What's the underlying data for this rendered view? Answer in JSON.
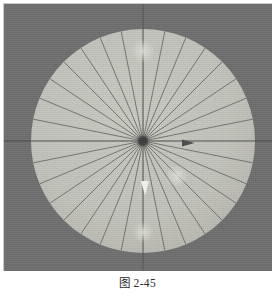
{
  "figure": {
    "caption": "图 2-45",
    "plate": {
      "background_color": "#6e6e6e",
      "border_color": "#c9c9c9",
      "width": 269,
      "height": 268
    }
  },
  "chart_data": {
    "type": "pie",
    "title": "图 2-45",
    "subtitle": "",
    "xlabel": "",
    "ylabel": "",
    "legend": [],
    "annotations": [
      {
        "name": "right-arrow-marker",
        "shape": "triangle-right",
        "color": "#4d4d4d",
        "x": 185,
        "y": 139,
        "size": 7
      },
      {
        "name": "down-arrow-marker",
        "shape": "triangle-down",
        "color": "#f2f2ee",
        "x": 141,
        "y": 186,
        "size": 9
      },
      {
        "name": "highlight-spot-upper",
        "shape": "soft-spot",
        "color": "#d8d8d2",
        "x": 139,
        "y": 47,
        "size": 12
      },
      {
        "name": "highlight-spot-lower-right",
        "shape": "soft-spot",
        "color": "#d6d6d0",
        "x": 173,
        "y": 172,
        "size": 11
      },
      {
        "name": "highlight-spot-bottom",
        "shape": "soft-spot",
        "color": "#d4d4ce",
        "x": 139,
        "y": 228,
        "size": 11
      }
    ],
    "disc": {
      "center_x": 139,
      "center_y": 137,
      "radius": 112,
      "fill_color": "#c3c3bc",
      "edge_color": "#b4b4ad"
    },
    "hub": {
      "center_x": 139,
      "center_y": 137,
      "radius": 7,
      "color": "#3c3c3c"
    },
    "spokes": {
      "count": 32,
      "start_angle_deg": 0,
      "step_angle_deg": 11.25,
      "line_color": "#6a6a66",
      "line_width": 0.9,
      "values": [
        11.25,
        11.25,
        11.25,
        11.25,
        11.25,
        11.25,
        11.25,
        11.25,
        11.25,
        11.25,
        11.25,
        11.25,
        11.25,
        11.25,
        11.25,
        11.25,
        11.25,
        11.25,
        11.25,
        11.25,
        11.25,
        11.25,
        11.25,
        11.25,
        11.25,
        11.25,
        11.25,
        11.25,
        11.25,
        11.25,
        11.25,
        11.25
      ],
      "categories": [
        "s1",
        "s2",
        "s3",
        "s4",
        "s5",
        "s6",
        "s7",
        "s8",
        "s9",
        "s10",
        "s11",
        "s12",
        "s13",
        "s14",
        "s15",
        "s16",
        "s17",
        "s18",
        "s19",
        "s20",
        "s21",
        "s22",
        "s23",
        "s24",
        "s25",
        "s26",
        "s27",
        "s28",
        "s29",
        "s30",
        "s31",
        "s32"
      ]
    },
    "axes": {
      "horizontal": {
        "y": 137,
        "x1": 0,
        "x2": 269,
        "color": "#4a4a4a",
        "width": 1
      },
      "vertical": {
        "x": 139,
        "y1": 0,
        "y2": 268,
        "color": "#5a5a5a",
        "width": 1
      },
      "grid": false
    },
    "ylim": [
      0,
      0
    ],
    "xlim": [
      0,
      0
    ]
  }
}
